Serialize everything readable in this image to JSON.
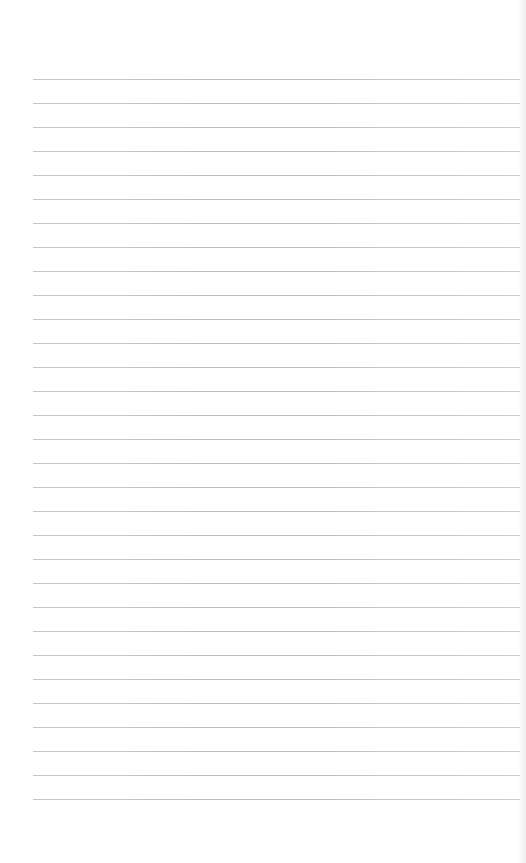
{
  "sheet": {
    "type": "lined-notepaper",
    "background_color": "#ffffff",
    "line_color": "#b8b8b8",
    "line_count": 31,
    "first_line_y": 79,
    "line_spacing": 24,
    "line_left": 33,
    "line_width": 487
  }
}
